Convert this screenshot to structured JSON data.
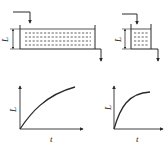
{
  "figure": {
    "tanks": [
      {
        "id": "left",
        "size": "wide",
        "level_label": "L",
        "has_inflow": true,
        "has_outflow": true
      },
      {
        "id": "right",
        "size": "narrow",
        "level_label": "L",
        "has_inflow": true,
        "has_outflow": true
      }
    ],
    "plots": [
      {
        "id": "left",
        "ylabel": "L",
        "xlabel": "t",
        "curve": "slow first-order rise"
      },
      {
        "id": "right",
        "ylabel": "L",
        "xlabel": "t",
        "curve": "fast first-order rise"
      }
    ]
  },
  "colors": {
    "line": "#2a2a2a",
    "background": "#ffffff"
  }
}
